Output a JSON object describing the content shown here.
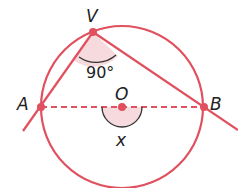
{
  "diagram": {
    "type": "circle-inscribed-angle",
    "colors": {
      "stroke": "#e0505e",
      "fill_shade": "#f7dadd",
      "arc": "#333333",
      "text": "#222222"
    },
    "circle": {
      "center_label": "O",
      "cx": 122,
      "cy": 107,
      "r": 81
    },
    "points": [
      {
        "label": "V",
        "x": 93,
        "y": 32
      },
      {
        "label": "A",
        "x": 41,
        "y": 107
      },
      {
        "label": "B",
        "x": 204,
        "y": 107
      },
      {
        "label": "O",
        "x": 122,
        "y": 107
      }
    ],
    "labels": {
      "v": "V",
      "a": "A",
      "b": "B",
      "o": "O",
      "angle_v": "90°",
      "angle_o": "x"
    },
    "segments": [
      {
        "from": "V",
        "to": "A",
        "extended": true,
        "style": "solid"
      },
      {
        "from": "V",
        "to": "B",
        "extended": true,
        "style": "solid"
      },
      {
        "from": "A",
        "to": "B",
        "style": "dashed",
        "note": "diameter"
      }
    ],
    "angles": [
      {
        "vertex": "V",
        "value": "90°",
        "description": "inscribed angle AVB"
      },
      {
        "vertex": "O",
        "value": "x",
        "description": "central angle AOB (straight, below diameter)"
      }
    ]
  }
}
